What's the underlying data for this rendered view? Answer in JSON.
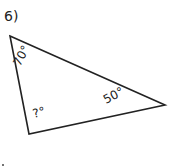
{
  "problem": {
    "number_label": "6)"
  },
  "triangle": {
    "vertices": {
      "top_left": [
        10,
        36
      ],
      "right": [
        165,
        105
      ],
      "bottom": [
        29,
        134
      ]
    },
    "angles": {
      "top_left": "70°",
      "right": "50°",
      "bottom": "?°"
    },
    "stroke_color": "#222222"
  }
}
